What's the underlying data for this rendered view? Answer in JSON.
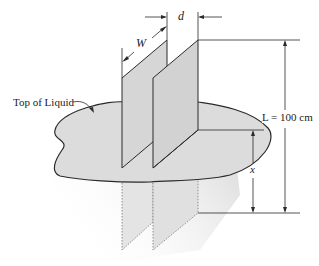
{
  "figure": {
    "labels": {
      "width": "W",
      "gap": "d",
      "liquid_surface": "Top of Liquid",
      "length": "L = 100 cm",
      "height": "x"
    },
    "colors": {
      "line": "#2a2a2a",
      "plate_fill": "#d9d9d9",
      "liquid_fill": "#dcdcdc",
      "shadow": "#e6e6e6",
      "background": "#ffffff"
    }
  }
}
